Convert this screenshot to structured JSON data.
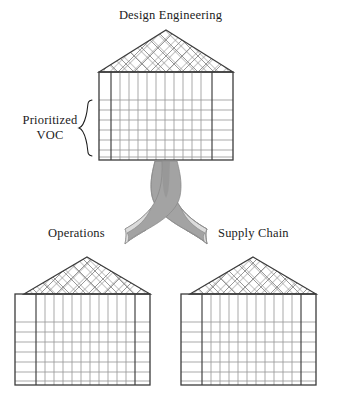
{
  "diagram": {
    "title_top": "Design Engineering",
    "side_label": "Prioritized\nVOC",
    "side_label_line1": "Prioritized",
    "side_label_line2": "VOC",
    "label_bottom_left": "Operations",
    "label_bottom_right": "Supply Chain",
    "type": "house-of-quality-cascade",
    "colors": {
      "outline": "#3b3b3b",
      "grid": "#9a9a9a",
      "roof_hatch": "#8c8c8c",
      "arrow_dark": "#9e9e9e",
      "arrow_light": "#d6d6d6",
      "arrow_stroke": "#8a8a8a",
      "background": "#ffffff",
      "text": "#1b1b1b"
    },
    "houses": [
      {
        "name": "design-engineering-house",
        "label": "Design Engineering",
        "body_cols_middle": 11,
        "body_rows": 7,
        "has_left_margin_column": true,
        "has_right_margin_column": true,
        "roof_hatch": "diagonal-cross"
      },
      {
        "name": "operations-house",
        "label": "Operations",
        "body_cols_middle": 11,
        "body_rows": 7,
        "has_left_margin_column": true,
        "has_right_margin_column": true,
        "roof_hatch": "diagonal-cross"
      },
      {
        "name": "supply-chain-house",
        "label": "Supply Chain",
        "body_cols_middle": 11,
        "body_rows": 7,
        "has_left_margin_column": true,
        "has_right_margin_column": true,
        "roof_hatch": "diagonal-cross"
      }
    ],
    "arrows": [
      {
        "name": "arrow-to-operations",
        "from": "design-engineering-house",
        "to": "operations-house"
      },
      {
        "name": "arrow-to-supply-chain",
        "from": "design-engineering-house",
        "to": "supply-chain-house"
      }
    ],
    "brace": {
      "name": "prioritized-voc-brace",
      "orientation": "left-facing"
    }
  }
}
